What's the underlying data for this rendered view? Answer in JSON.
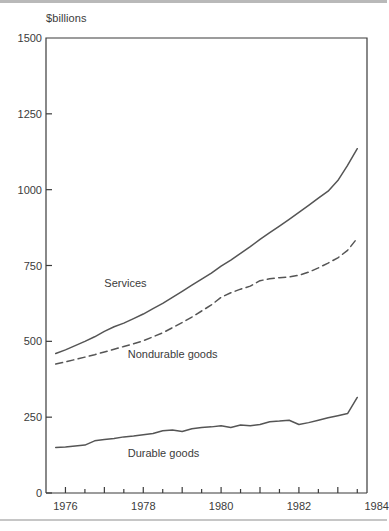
{
  "chart_data": {
    "type": "line",
    "title": "",
    "subtitle": "",
    "xlabel": "",
    "ylabel": "$billions",
    "xlim": [
      1975.5,
      1983.75
    ],
    "ylim": [
      0,
      1500
    ],
    "yticks": [
      0,
      250,
      500,
      750,
      1000,
      1250,
      1500
    ],
    "ytick_labels": [
      "0",
      "250",
      "500",
      "750",
      "1000",
      "1250",
      "1500"
    ],
    "xticks": [
      1976,
      1977,
      1978,
      1979,
      1980,
      1981,
      1982,
      1983,
      1984
    ],
    "xtick_labels_shown": [
      "1976",
      "1978",
      "1980",
      "1982",
      "1984"
    ],
    "minor_xticks_interval": 0.5,
    "grid": false,
    "legend_position": "inline-annotations",
    "line_color": "#555555",
    "axis_color": "#3b3b3b",
    "background": "#ffffff",
    "x": [
      1975.75,
      1976.0,
      1976.25,
      1976.5,
      1976.75,
      1977.0,
      1977.25,
      1977.5,
      1977.75,
      1978.0,
      1978.25,
      1978.5,
      1978.75,
      1979.0,
      1979.25,
      1979.5,
      1979.75,
      1980.0,
      1980.25,
      1980.5,
      1980.75,
      1981.0,
      1981.25,
      1981.5,
      1981.75,
      1982.0,
      1982.25,
      1982.5,
      1982.75,
      1983.0,
      1983.25,
      1983.5
    ],
    "series": [
      {
        "name": "Services",
        "label": "Services",
        "style": "solid",
        "label_x": 1977.0,
        "label_y": 690,
        "values": [
          460,
          472,
          486,
          500,
          515,
          533,
          548,
          560,
          575,
          590,
          608,
          625,
          645,
          665,
          685,
          705,
          725,
          748,
          768,
          790,
          812,
          836,
          858,
          880,
          902,
          925,
          948,
          972,
          995,
          1030,
          1080,
          1135
        ]
      },
      {
        "name": "Nondurable goods",
        "label": "Nondurable goods",
        "style": "dashed",
        "label_x": 1977.6,
        "label_y": 455,
        "values": [
          425,
          432,
          440,
          448,
          456,
          465,
          474,
          483,
          492,
          502,
          515,
          528,
          545,
          562,
          580,
          600,
          620,
          645,
          660,
          672,
          682,
          700,
          706,
          710,
          712,
          718,
          728,
          742,
          758,
          775,
          800,
          840
        ]
      },
      {
        "name": "Durable goods",
        "label": "Durable goods",
        "style": "solid",
        "label_x": 1977.6,
        "label_y": 130,
        "values": [
          150,
          152,
          155,
          158,
          172,
          176,
          180,
          185,
          188,
          192,
          196,
          205,
          208,
          203,
          212,
          216,
          218,
          222,
          216,
          224,
          222,
          226,
          235,
          237,
          240,
          226,
          232,
          240,
          248,
          255,
          262,
          315
        ]
      }
    ]
  },
  "plot_frame": {
    "left_px": 46,
    "top_px": 38,
    "right_px": 367,
    "bottom_px": 493
  }
}
